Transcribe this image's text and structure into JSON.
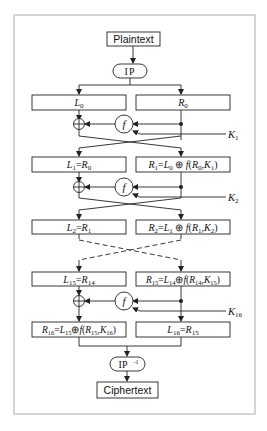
{
  "diagram": {
    "type": "DES Feistel network",
    "frame_color": "#c8c8c8",
    "line_color": "#222222",
    "input": {
      "label": "Plaintext"
    },
    "initial_permutation": {
      "label": "IP"
    },
    "final_permutation": {
      "label": "IP",
      "superscript": "-1"
    },
    "output": {
      "label": "Ciphertext"
    },
    "rounds": [
      {
        "left": "L0",
        "right": "R0",
        "key": "K1"
      },
      {
        "left": "L1=R0",
        "right": "R1=L0 ⊕ f(R0,K1)",
        "key": "K2"
      },
      {
        "left": "L2=R1",
        "right": "R2=L1 ⊕ f(R1,K2)"
      },
      {
        "left": "L15=R14",
        "right": "R15=L14 ⊕ f(R14,K15)",
        "key": "K16"
      },
      {
        "left": "R16=L15 ⊕ f(R15,K16)",
        "right": "L16=R15"
      }
    ],
    "function_label": "f",
    "xor_symbol": "⊕"
  }
}
